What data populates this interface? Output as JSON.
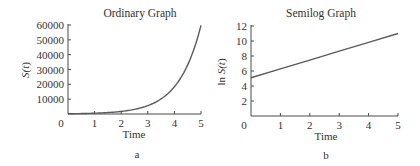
{
  "chart_data": [
    {
      "type": "line",
      "panel_label": "a",
      "title": "Ordinary Graph",
      "xlabel": "Time",
      "ylabel": "S(t)",
      "xlim": [
        0,
        5
      ],
      "ylim": [
        0,
        60000
      ],
      "xticks": [
        0,
        1,
        2,
        3,
        4,
        5
      ],
      "yticks": [
        10000,
        20000,
        30000,
        40000,
        50000,
        60000
      ],
      "grid": false,
      "legend": null,
      "series": [
        {
          "name": "S(t)",
          "x": [
            0,
            0.5,
            1,
            1.5,
            2,
            2.5,
            3,
            3.5,
            4,
            4.5,
            5
          ],
          "y": [
            164,
            296,
            534,
            963,
            1737,
            3133,
            5649,
            10188,
            18374,
            33136,
            59759
          ]
        }
      ]
    },
    {
      "type": "line",
      "panel_label": "b",
      "title": "Semilog Graph",
      "xlabel": "Time",
      "ylabel": "ln S(t)",
      "xlim": [
        0,
        5
      ],
      "ylim": [
        0,
        12
      ],
      "xticks": [
        0,
        1,
        2,
        3,
        4,
        5
      ],
      "yticks": [
        2,
        4,
        6,
        8,
        10,
        12
      ],
      "grid": false,
      "legend": null,
      "series": [
        {
          "name": "ln S(t)",
          "x": [
            0,
            1,
            2,
            3,
            4,
            5
          ],
          "y": [
            5.1,
            6.28,
            7.46,
            8.64,
            9.82,
            11.0
          ]
        }
      ]
    }
  ],
  "panels": {
    "a": {
      "title": "Ordinary Graph",
      "xlabel": "Time",
      "ylabel_main": "S(",
      "ylabel_var": "t",
      "ylabel_close": ")",
      "label": "a",
      "origin_label": "0"
    },
    "b": {
      "title": "Semilog Graph",
      "xlabel": "Time",
      "ylabel_prefix": "ln ",
      "ylabel_main": "S(",
      "ylabel_var": "t",
      "ylabel_close": ")",
      "label": "b",
      "origin_label": "0"
    }
  }
}
